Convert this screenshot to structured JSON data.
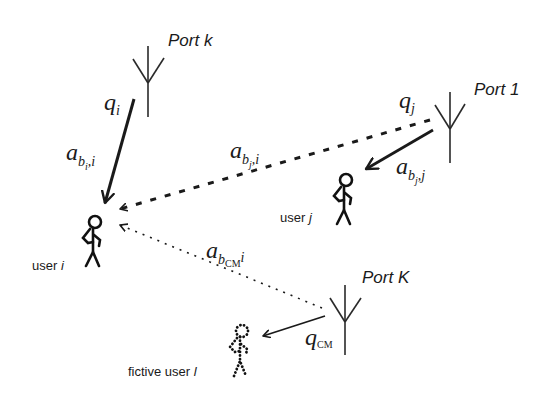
{
  "diagram": {
    "ports": [
      {
        "id": "port-k",
        "label": "Port k"
      },
      {
        "id": "port-1",
        "label": "Port 1"
      },
      {
        "id": "port-K",
        "label": "Port K"
      }
    ],
    "users": [
      {
        "id": "user-i",
        "label_text": "user ",
        "label_var": "i"
      },
      {
        "id": "user-j",
        "label_text": "user ",
        "label_var": "j"
      },
      {
        "id": "fictive-user-l",
        "label_text": "fictive user ",
        "label_var": "l"
      }
    ],
    "symbols": {
      "q_i": {
        "base": "q",
        "sub": "i"
      },
      "q_j": {
        "base": "q",
        "sub": "j"
      },
      "q_cm": {
        "base": "q",
        "sub": "CM"
      },
      "a_bi_i": {
        "base": "a",
        "sub": "b",
        "subsub": "i",
        "tail": ",i"
      },
      "a_bj_i": {
        "base": "a",
        "sub": "b",
        "subsub": "j",
        "tail": ",i"
      },
      "a_bj_j": {
        "base": "a",
        "sub": "b",
        "subsub": "j",
        "tail": ",j"
      },
      "a_bcm_i": {
        "base": "a",
        "sub": "b",
        "subsub": "CM",
        "tail": "i"
      }
    },
    "links": [
      {
        "from": "port-k",
        "to": "user-i",
        "style": "solid",
        "label": "a_bi_i"
      },
      {
        "from": "port-1",
        "to": "user-i",
        "style": "dashed",
        "label": "a_bj_i"
      },
      {
        "from": "port-1",
        "to": "user-j",
        "style": "solid",
        "label": "a_bj_j"
      },
      {
        "from": "port-K",
        "to": "user-i",
        "style": "dotted",
        "label": "a_bcm_i"
      },
      {
        "from": "port-K",
        "to": "fictive-user-l",
        "style": "solid",
        "label": "q_cm"
      }
    ],
    "colors": {
      "ink": "#1a1a1a",
      "background": "#ffffff"
    }
  }
}
